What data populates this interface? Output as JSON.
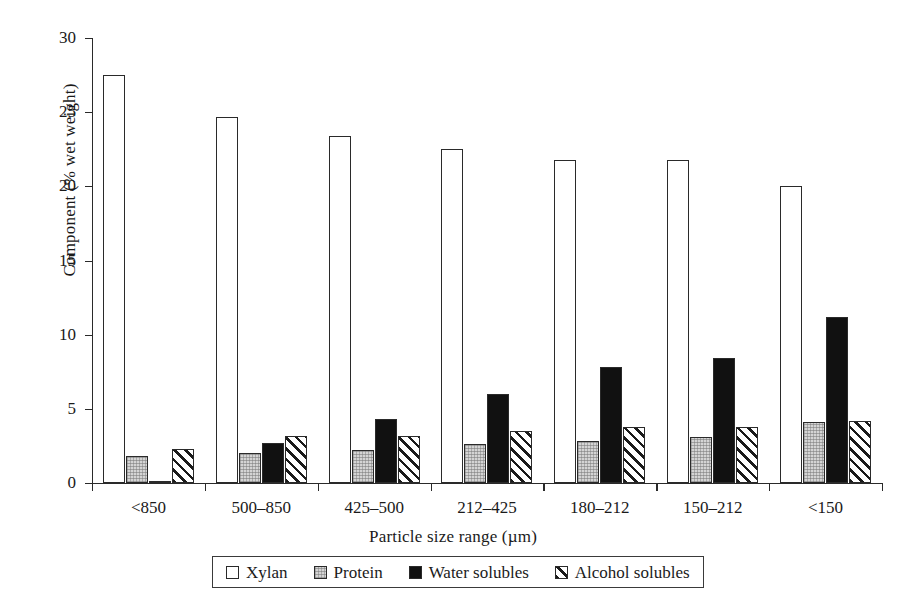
{
  "chart_data": {
    "type": "bar",
    "title": "",
    "subtitle": "",
    "xlabel": "Particle size range (µm)",
    "ylabel": "Component (% wet weight)",
    "categories": [
      "<850",
      "500–850",
      "425–500",
      "212–425",
      "180–212",
      "150–212",
      "<150"
    ],
    "series": [
      {
        "name": "Xylan",
        "key": "xylan",
        "values": [
          27.5,
          24.7,
          23.4,
          22.5,
          21.8,
          21.8,
          20.0
        ]
      },
      {
        "name": "Protein",
        "key": "protein",
        "values": [
          1.8,
          2.0,
          2.2,
          2.6,
          2.8,
          3.1,
          4.1
        ]
      },
      {
        "name": "Water solubles",
        "key": "water",
        "values": [
          0.1,
          2.7,
          4.3,
          6.0,
          7.8,
          8.4,
          11.2
        ]
      },
      {
        "name": "Alcohol solubles",
        "key": "alcohol",
        "values": [
          2.3,
          3.2,
          3.2,
          3.5,
          3.8,
          3.8,
          4.2
        ]
      }
    ],
    "ylim": [
      0,
      30
    ],
    "yticks": [
      0,
      5,
      10,
      15,
      20,
      25,
      30
    ],
    "ytick_labels": [
      "0",
      "5",
      "10",
      "15",
      "20",
      "25",
      "30"
    ],
    "grid": false,
    "legend_position": "bottom-center"
  },
  "legend": {
    "items": [
      {
        "label": "Xylan",
        "swatch": "open-square-swatch"
      },
      {
        "label": "Protein",
        "swatch": "stippled-square-swatch"
      },
      {
        "label": "Water solubles",
        "swatch": "filled-square-swatch"
      },
      {
        "label": "Alcohol solubles",
        "swatch": "hatched-square-swatch"
      }
    ]
  },
  "colors": {
    "axis": "#2a2a2a",
    "xylan": "#ffffff",
    "protein": "#d4d4d4",
    "water": "#111111",
    "alcohol": "#ffffff",
    "background": "#ffffff"
  }
}
